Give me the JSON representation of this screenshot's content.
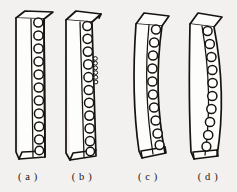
{
  "figure": {
    "name": "four-bar-specimen-diagram",
    "background_color": "#f2f1ef",
    "ink_color": "#17130f",
    "panel_count": 4,
    "panels": [
      {
        "id": "a",
        "caption": "( a )",
        "caption_x": 28,
        "shape": "straight",
        "description": "straight rectangular bar in 3D perspective with single vertical row of round holes on right face",
        "hole_count": 11,
        "hole_radius": 4.6,
        "has_secondary_hole_row": false,
        "top_x": 16,
        "bottom_x": 13,
        "top_y": 18,
        "bottom_y": 158,
        "body_width": 28,
        "depth_dx": 9,
        "depth_dy": -7
      },
      {
        "id": "b",
        "caption": "( b )",
        "caption_x": 82,
        "shape": "straight",
        "description": "straight bar like (a) with an additional narrow secondary column of small holes beside the main row",
        "hole_count": 11,
        "hole_radius": 4.6,
        "has_secondary_hole_row": true,
        "secondary_hole_count": 6,
        "secondary_hole_radius": 1.9,
        "top_x": 66,
        "bottom_x": 63,
        "top_y": 16,
        "bottom_y": 160,
        "body_width": 30,
        "depth_dx": 10,
        "depth_dy": -8
      },
      {
        "id": "c",
        "caption": "( c )",
        "caption_x": 148,
        "shape": "s-curved",
        "description": "bar bent into a slight S / leaning curve, holes follow the curved right face",
        "hole_count": 10,
        "hole_radius": 4.6,
        "has_secondary_hole_row": false,
        "top_x": 136,
        "bottom_x": 140,
        "top_y": 17,
        "bottom_y": 158,
        "body_width": 27,
        "depth_dx": 9,
        "depth_dy": -7,
        "bow_amount": -9
      },
      {
        "id": "d",
        "caption": "( d )",
        "caption_x": 208,
        "shape": "bowed-arc",
        "description": "bar bowed into an arc bulging right, holes follow the convex curved edge",
        "hole_count": 10,
        "hole_radius": 4.6,
        "has_secondary_hole_row": false,
        "top_x": 190,
        "bottom_x": 190,
        "top_y": 17,
        "bottom_y": 160,
        "body_width": 28,
        "depth_dx": 9,
        "depth_dy": -7,
        "bow_amount": 11
      }
    ],
    "caption_baseline_y": 180
  }
}
